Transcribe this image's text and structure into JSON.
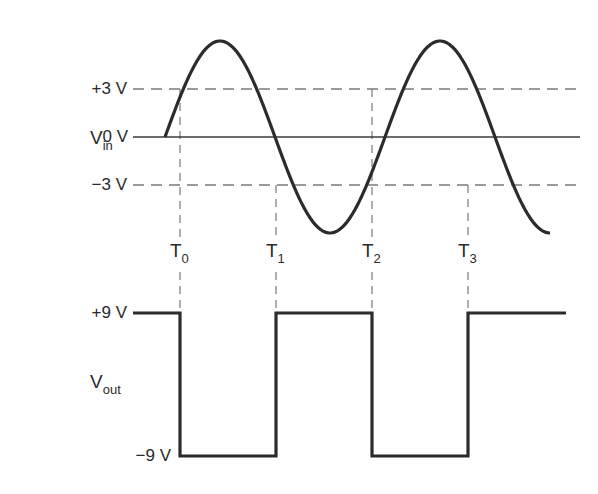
{
  "chart_data": {
    "type": "line",
    "signals": [
      {
        "name": "Vin",
        "label_main": "V",
        "label_sub": "in",
        "waveform": "sine",
        "amplitude_pixels": 96,
        "start_x_px": 165,
        "period_px": 220,
        "cycles": 1.75,
        "y_ticks": [
          {
            "label": "+3 V",
            "value": 3,
            "y_px": 89,
            "style": "dashed"
          },
          {
            "label": "0 V",
            "value": 0,
            "y_px": 137,
            "style": "solid"
          },
          {
            "label": "−3 V",
            "value": -3,
            "y_px": 185,
            "style": "dashed"
          }
        ],
        "axis_x_range_px": [
          133,
          580
        ],
        "threshold_lines_x_range_px": [
          133,
          577
        ]
      },
      {
        "name": "Vout",
        "label_main": "V",
        "label_sub": "out",
        "waveform": "square",
        "y_ticks": [
          {
            "label": "+9 V",
            "value": 9,
            "y_px": 313
          },
          {
            "label": "−9 V",
            "value": -9,
            "y_px": 456
          }
        ],
        "levels": [
          {
            "from_x": 133,
            "to_x": 180,
            "value": 9
          },
          {
            "from_x": 180,
            "to_x": 276,
            "value": -9
          },
          {
            "from_x": 276,
            "to_x": 372,
            "value": 9
          },
          {
            "from_x": 372,
            "to_x": 468,
            "value": -9
          },
          {
            "from_x": 468,
            "to_x": 566,
            "value": 9
          }
        ]
      }
    ],
    "time_markers": [
      {
        "label_main": "T",
        "label_sub": "0",
        "x_px": 180,
        "crosses": "+3 V rising"
      },
      {
        "label_main": "T",
        "label_sub": "1",
        "x_px": 276,
        "crosses": "−3 V falling"
      },
      {
        "label_main": "T",
        "label_sub": "2",
        "x_px": 372,
        "crosses": "+3 V rising"
      },
      {
        "label_main": "T",
        "label_sub": "3",
        "x_px": 468,
        "crosses": "−3 V falling"
      }
    ],
    "xlabel": "",
    "ylabel": "",
    "grid": false,
    "legend": "none"
  },
  "colors": {
    "trace": "#2b2b2b",
    "axis": "#3a3a3a",
    "dashed": "#7a7a7a",
    "text": "#2a2a2a"
  }
}
